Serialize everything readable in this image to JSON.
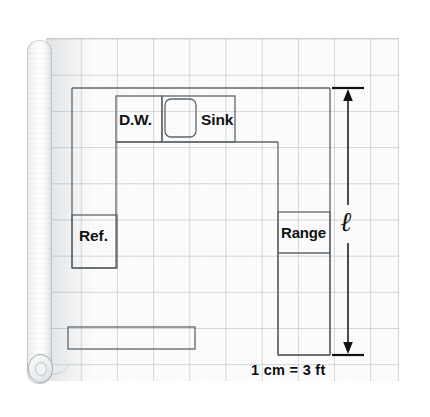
{
  "figure": {
    "kind": "scale-drawing-kitchen-floor-plan",
    "medium": "graph-paper-roll"
  },
  "labels": {
    "dishwasher": "D.W.",
    "sink": "Sink",
    "refrigerator": "Ref.",
    "range": "Range",
    "length_variable": "ℓ"
  },
  "scale": {
    "text": "1 cm = 3 ft",
    "unit_from": "1 cm",
    "unit_to": "3 ft"
  },
  "dimension": {
    "name": "ℓ",
    "orientation": "vertical",
    "grid_squares_spanned": 8,
    "endpoints": [
      "top-counter-line",
      "bottom-of-range-run"
    ]
  },
  "grid": {
    "square_size_px": 36,
    "columns": 10,
    "rows": 10,
    "line_color": "#9aa4ae"
  },
  "colors": {
    "paper": "#fdfdfd",
    "grid_line": "#96a0aa",
    "ink": "#111214",
    "cabinet_outline": "#6e7478",
    "roll_shadow": "#d3d6d9"
  },
  "shapes": [
    {
      "name": "counter-run-outline",
      "type": "polyline"
    },
    {
      "name": "dishwasher-box",
      "type": "rect"
    },
    {
      "name": "sink-basin",
      "type": "rounded-rect"
    },
    {
      "name": "sink-box",
      "type": "rect"
    },
    {
      "name": "refrigerator-box",
      "type": "rect"
    },
    {
      "name": "range-box",
      "type": "rect"
    },
    {
      "name": "range-burner-divider",
      "type": "line"
    },
    {
      "name": "island-counter",
      "type": "rect"
    },
    {
      "name": "dimension-arrow",
      "type": "double-arrow"
    }
  ]
}
